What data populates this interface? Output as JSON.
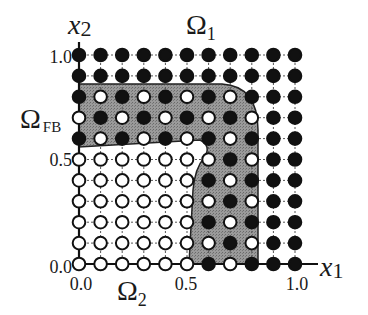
{
  "axes": {
    "x_label": "x",
    "x_sub": "1",
    "y_label": "x",
    "y_sub": "2",
    "x_ticks": [
      "0.0",
      "0.5",
      "1.0"
    ],
    "y_ticks": [
      "0.0",
      "0.5",
      "1.0"
    ]
  },
  "regions": {
    "omega1": {
      "symbol": "Ω",
      "sub": "1"
    },
    "omega2": {
      "symbol": "Ω",
      "sub": "2"
    },
    "omega_fb": {
      "symbol": "Ω",
      "sub": "FB"
    }
  },
  "colors": {
    "shade": "#8a8a8a",
    "filled_node": "#111111",
    "open_node": "#ffffff",
    "line": "#222222"
  },
  "grid": {
    "cols": 11,
    "rows": 11,
    "legend": "B = filled node, W = open node; rows from x2=1.0 (top) to x2=0.0 (bottom)",
    "nodes": [
      "BBBBBBBBBBB",
      "BBBBBBBBBBB",
      "BWBWBWBWBBB",
      "WBWBWBWBWBB",
      "BWBWBWBWBBB",
      "WWWWWWWBWBB",
      "WWWWWWBWBBB",
      "WWWWWWWBWBB",
      "WWWWWWBWBBB",
      "WWWWWWWBWBB",
      "WWWWWWBWBBB"
    ]
  }
}
